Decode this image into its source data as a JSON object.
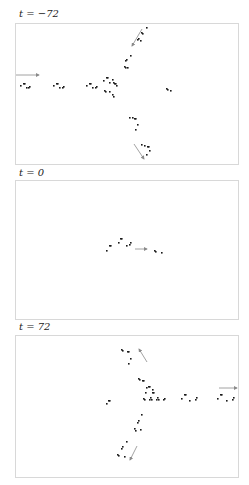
{
  "panels": [
    {
      "label": "t = −72",
      "label_top": 8,
      "frame": {
        "top": 23,
        "height": 140
      },
      "cells": [
        [
          4,
          61
        ],
        [
          7,
          59
        ],
        [
          8,
          59
        ],
        [
          10,
          63
        ],
        [
          12,
          63
        ],
        [
          13,
          62
        ],
        [
          37,
          61
        ],
        [
          40,
          59
        ],
        [
          41,
          59
        ],
        [
          43,
          63
        ],
        [
          46,
          63
        ],
        [
          47,
          62
        ],
        [
          70,
          61
        ],
        [
          73,
          59
        ],
        [
          74,
          59
        ],
        [
          76,
          63
        ],
        [
          79,
          63
        ],
        [
          80,
          62
        ],
        [
          87,
          56
        ],
        [
          90,
          53
        ],
        [
          91,
          53
        ],
        [
          93,
          58
        ],
        [
          96,
          55
        ],
        [
          97,
          58
        ],
        [
          98,
          59
        ],
        [
          99,
          59
        ],
        [
          100,
          61
        ],
        [
          88,
          66
        ],
        [
          89,
          67
        ],
        [
          93,
          67
        ],
        [
          96,
          70
        ],
        [
          97,
          72
        ],
        [
          150,
          64
        ],
        [
          151,
          65
        ],
        [
          154,
          66
        ],
        [
          108,
          42
        ],
        [
          109,
          43
        ],
        [
          111,
          43
        ],
        [
          109,
          36
        ],
        [
          110,
          35
        ],
        [
          114,
          31
        ],
        [
          121,
          15
        ],
        [
          122,
          14
        ],
        [
          124,
          16
        ],
        [
          126,
          9
        ],
        [
          125,
          8
        ],
        [
          130,
          3
        ],
        [
          113,
          93
        ],
        [
          116,
          93
        ],
        [
          118,
          94
        ],
        [
          119,
          94
        ],
        [
          121,
          100
        ],
        [
          119,
          105
        ],
        [
          125,
          120
        ],
        [
          128,
          121
        ],
        [
          131,
          122
        ],
        [
          132,
          122
        ],
        [
          133,
          126
        ],
        [
          130,
          130
        ]
      ],
      "arrows": [
        {
          "x1": 0,
          "y1": 51,
          "x2": 23,
          "y2": 51,
          "direction": "east"
        },
        {
          "x1": 126,
          "y1": 5,
          "x2": 116,
          "y2": 22,
          "direction": "southwest"
        },
        {
          "x1": 118,
          "y1": 120,
          "x2": 128,
          "y2": 135,
          "direction": "southeast-from-below"
        }
      ]
    },
    {
      "label": "t = 0",
      "label_top": 167,
      "frame": {
        "top": 180,
        "height": 138
      },
      "cells": [
        [
          90,
          69
        ],
        [
          93,
          64
        ],
        [
          94,
          64
        ],
        [
          102,
          61
        ],
        [
          104,
          57
        ],
        [
          105,
          57
        ],
        [
          110,
          64
        ],
        [
          113,
          63
        ],
        [
          114,
          61
        ],
        [
          138,
          69
        ],
        [
          139,
          70
        ],
        [
          145,
          71
        ]
      ],
      "arrows": [
        {
          "x1": 119,
          "y1": 68,
          "x2": 131,
          "y2": 68,
          "direction": "east"
        }
      ]
    },
    {
      "label": "t = 72",
      "label_top": 321,
      "frame": {
        "top": 335,
        "height": 141
      },
      "cells": [
        [
          105,
          13
        ],
        [
          106,
          14
        ],
        [
          111,
          15
        ],
        [
          112,
          15
        ],
        [
          114,
          22
        ],
        [
          112,
          27
        ],
        [
          122,
          42
        ],
        [
          123,
          43
        ],
        [
          126,
          44
        ],
        [
          127,
          44
        ],
        [
          130,
          51
        ],
        [
          129,
          56
        ],
        [
          132,
          50
        ],
        [
          133,
          50
        ],
        [
          136,
          56
        ],
        [
          137,
          56
        ],
        [
          136,
          53
        ],
        [
          127,
          62
        ],
        [
          128,
          63
        ],
        [
          134,
          61
        ],
        [
          135,
          63
        ],
        [
          133,
          63
        ],
        [
          141,
          61
        ],
        [
          142,
          63
        ],
        [
          140,
          63
        ],
        [
          148,
          62
        ],
        [
          147,
          63
        ],
        [
          90,
          67
        ],
        [
          92,
          64
        ],
        [
          93,
          64
        ],
        [
          165,
          62
        ],
        [
          168,
          58
        ],
        [
          169,
          58
        ],
        [
          173,
          64
        ],
        [
          179,
          63
        ],
        [
          180,
          61
        ],
        [
          201,
          62
        ],
        [
          204,
          58
        ],
        [
          205,
          58
        ],
        [
          210,
          64
        ],
        [
          216,
          63
        ],
        [
          217,
          61
        ],
        [
          125,
          78
        ],
        [
          121,
          86
        ],
        [
          122,
          84
        ],
        [
          118,
          92
        ],
        [
          119,
          94
        ],
        [
          124,
          93
        ],
        [
          110,
          105
        ],
        [
          105,
          112
        ],
        [
          106,
          110
        ],
        [
          101,
          118
        ],
        [
          102,
          119
        ],
        [
          108,
          120
        ]
      ],
      "arrows": [
        {
          "x1": 131,
          "y1": 26,
          "x2": 123,
          "y2": 13,
          "direction": "northwest"
        },
        {
          "x1": 203,
          "y1": 52,
          "x2": 221,
          "y2": 52,
          "direction": "east"
        },
        {
          "x1": 121,
          "y1": 110,
          "x2": 114,
          "y2": 124,
          "direction": "southwest"
        }
      ]
    }
  ],
  "colors": {
    "cell": "#1a1a1a",
    "arrow": "#8a8a8a",
    "frame": "#d8d8d8"
  }
}
